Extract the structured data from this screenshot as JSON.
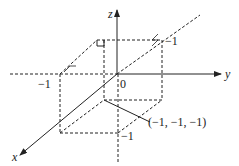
{
  "diagram": {
    "type": "3d-coordinate-box",
    "axes": {
      "x": {
        "label": "x"
      },
      "y": {
        "label": "y"
      },
      "z": {
        "label": "z"
      }
    },
    "labels": {
      "origin": "0",
      "y_neg_one": "−1",
      "z_neg_one": "−1",
      "x_neg_one": "−1",
      "point": "(−1, −1, −1)"
    },
    "colors": {
      "line": "#222222",
      "background": "#ffffff"
    }
  }
}
